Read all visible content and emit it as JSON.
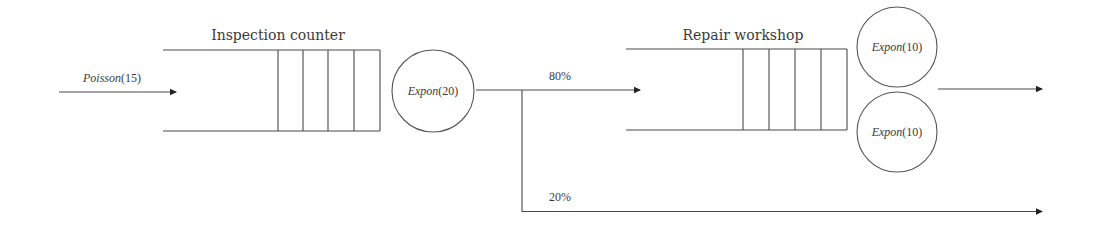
{
  "diagram": {
    "type": "queueing-network",
    "arrival": {
      "label_fn": "Poisson",
      "label_arg": "(15)"
    },
    "stations": [
      {
        "title": "Inspection counter",
        "queue_slots": 4,
        "servers": [
          {
            "label_fn": "Expon",
            "label_arg": "(20)"
          }
        ]
      },
      {
        "title": "Repair workshop",
        "queue_slots": 4,
        "servers": [
          {
            "label_fn": "Expon",
            "label_arg": "(10)"
          },
          {
            "label_fn": "Expon",
            "label_arg": "(10)"
          }
        ]
      }
    ],
    "routing": {
      "to_repair": "80%",
      "bypass": "20%"
    },
    "colors": {
      "line": "#4a4a4a",
      "text": "#3a3a3a",
      "background": "#ffffff"
    }
  }
}
